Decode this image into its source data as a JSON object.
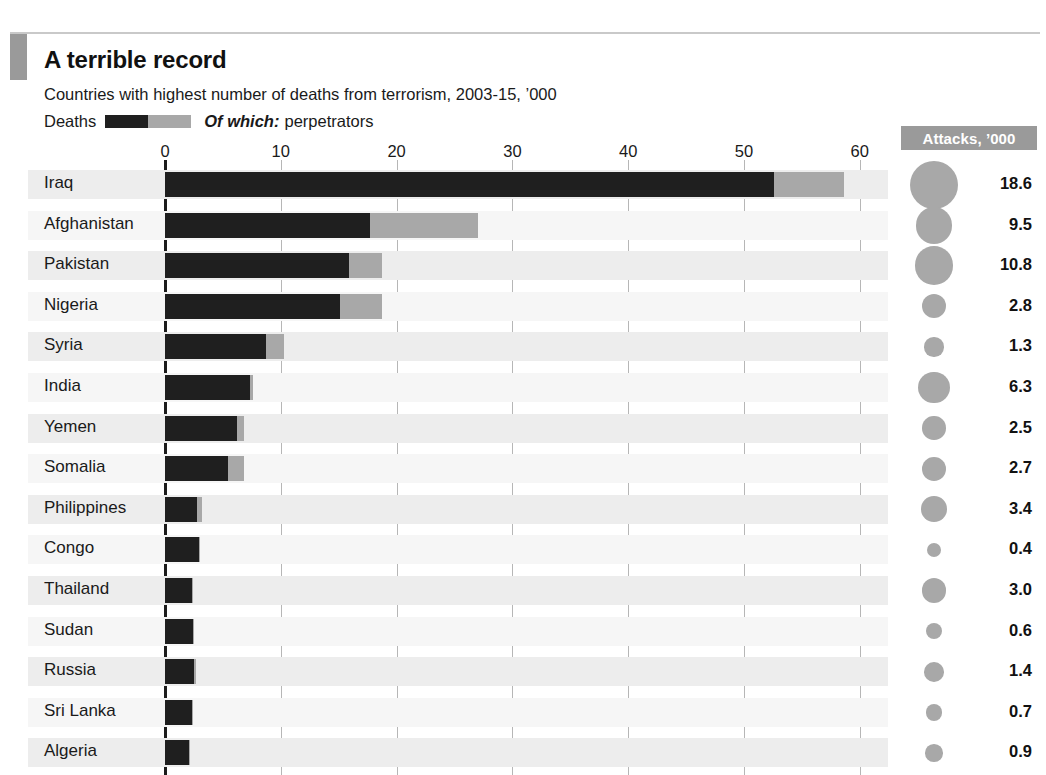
{
  "header": {
    "title": "A terrible record",
    "subtitle": "Countries with highest number of deaths from terrorism, 2003-15, ’000",
    "accent_color": "#9a9a9a"
  },
  "legend": {
    "deaths_label": "Deaths",
    "of_which_label": "Of which:",
    "perpetrators_label": "perpetrators",
    "deaths_color": "#1f1f1f",
    "perpetrators_color": "#a8a8a8"
  },
  "attacks_column": {
    "header": "Attacks, ’000",
    "header_bg": "#9a9a9a",
    "bubble_color": "#a8a8a8"
  },
  "chart_data": {
    "type": "bar",
    "title": "A terrible record",
    "subtitle": "Countries with highest number of deaths from terrorism, 2003-15, ’000",
    "orientation": "horizontal",
    "stacked": true,
    "xlabel": "",
    "ylabel": "",
    "xlim": [
      0,
      63
    ],
    "xticks": [
      0,
      10,
      20,
      30,
      40,
      50,
      60
    ],
    "xtick_labels": [
      "0",
      "10",
      "20",
      "30",
      "40",
      "50",
      "60"
    ],
    "grid": "vertical",
    "legend_position": "top-left",
    "categories": [
      "Iraq",
      "Afghanistan",
      "Pakistan",
      "Nigeria",
      "Syria",
      "India",
      "Yemen",
      "Somalia",
      "Philippines",
      "Congo",
      "Thailand",
      "Sudan",
      "Russia",
      "Sri Lanka",
      "Algeria"
    ],
    "series": [
      {
        "name": "Deaths (excluding perpetrators)",
        "color": "#1f1f1f",
        "values": [
          52.6,
          17.7,
          15.9,
          15.1,
          8.7,
          7.3,
          6.2,
          5.4,
          2.8,
          2.9,
          2.3,
          2.4,
          2.5,
          2.3,
          2.1
        ]
      },
      {
        "name": "Of which: perpetrators",
        "color": "#a8a8a8",
        "values": [
          6.0,
          9.3,
          2.8,
          3.6,
          1.6,
          0.3,
          0.6,
          1.4,
          0.4,
          0.1,
          0.1,
          0.1,
          0.2,
          0.1,
          0.1
        ]
      }
    ],
    "totals": [
      58.6,
      27.0,
      18.7,
      18.7,
      10.3,
      7.6,
      6.8,
      6.8,
      3.2,
      3.0,
      2.4,
      2.5,
      2.7,
      2.4,
      2.2
    ],
    "bubble_series": {
      "name": "Attacks, ’000",
      "color": "#a8a8a8",
      "values": [
        18.6,
        9.5,
        10.8,
        2.8,
        1.3,
        6.3,
        2.5,
        2.7,
        3.4,
        0.4,
        3.0,
        0.6,
        1.4,
        0.7,
        0.9
      ],
      "labels": [
        "18.6",
        "9.5",
        "10.8",
        "2.8",
        "1.3",
        "6.3",
        "2.5",
        "2.7",
        "3.4",
        "0.4",
        "3.0",
        "0.6",
        "1.4",
        "0.7",
        "0.9"
      ]
    }
  }
}
